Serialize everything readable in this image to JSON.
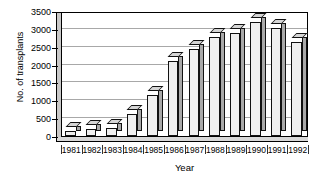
{
  "chart_data": {
    "type": "bar",
    "title": "",
    "xlabel": "Year",
    "ylabel": "No. of transplants",
    "categories": [
      "1981",
      "1982",
      "1983",
      "1984",
      "1985",
      "1986",
      "1987",
      "1988",
      "1989",
      "1990",
      "1991",
      "1992"
    ],
    "values": [
      150,
      190,
      220,
      620,
      1150,
      2100,
      2450,
      2780,
      2880,
      3180,
      3020,
      2620
    ],
    "series": [
      {
        "name": "No. of transplants",
        "values": [
          150,
          190,
          220,
          620,
          1150,
          2100,
          2450,
          2780,
          2880,
          3180,
          3020,
          2620
        ]
      }
    ],
    "ylim": [
      0,
      3500
    ],
    "ytick_values": [
      0,
      500,
      1000,
      1500,
      2000,
      2500,
      3000,
      3500
    ],
    "ytick_labels": [
      "0",
      "500",
      "1000",
      "1500",
      "2000",
      "2500",
      "3000",
      "3500"
    ],
    "grid": true,
    "grid_axis": "y",
    "legend": false,
    "legend_position": "none",
    "style": "3d-bar",
    "colors": {
      "bar_face": "#efefef",
      "bar_side": "#a9a9a9",
      "bar_top": "#d5d5d5",
      "bar_outline": "#111111",
      "gridline": "#a8a8a8",
      "axis": "#000000",
      "background": "#ffffff"
    }
  }
}
